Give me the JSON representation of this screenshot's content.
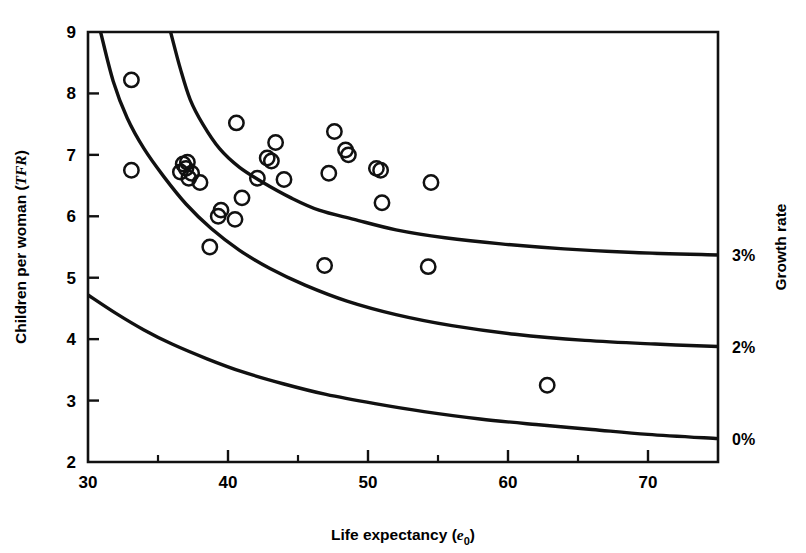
{
  "figure": {
    "background_color": "#ffffff",
    "ink_color": "#111111"
  },
  "axes": {
    "x": {
      "label_main": "Life expectancy (",
      "label_italic": "e",
      "label_sub": "0",
      "label_close": ")",
      "label_full": "Life expectancy (e0)",
      "min": 30,
      "max": 75,
      "major_ticks": [
        30,
        40,
        50,
        60,
        70
      ],
      "major_tick_labels": [
        "30",
        "40",
        "50",
        "60",
        "70"
      ],
      "minor_ticks": [
        35,
        45,
        55,
        65,
        75
      ]
    },
    "y": {
      "label_main": "Children per woman (",
      "label_italic": "TFR",
      "label_close": ")",
      "label_full": "Children per woman (TFR)",
      "min": 2,
      "max": 9,
      "major_ticks": [
        2,
        3,
        4,
        5,
        6,
        7,
        8,
        9
      ],
      "major_tick_labels": [
        "2",
        "3",
        "4",
        "5",
        "6",
        "7",
        "8",
        "9"
      ]
    },
    "right": {
      "label_full": "Growth rate",
      "tick_labels": [
        "3%",
        "2%",
        "0%"
      ],
      "tick_values_tfr": [
        5.37,
        3.88,
        2.38
      ]
    }
  },
  "chart_data": {
    "type": "scatter",
    "title": "",
    "xlabel": "Life expectancy (e0)",
    "ylabel": "Children per woman (TFR)",
    "xlim": [
      30,
      75
    ],
    "ylim": [
      2,
      9
    ],
    "grid": false,
    "legend": "none",
    "series": [
      {
        "name": "Countries",
        "marker": "open-circle",
        "x": [
          33.1,
          33.1,
          36.6,
          36.8,
          37.0,
          37.2,
          37.1,
          37.4,
          38.0,
          38.7,
          39.3,
          39.5,
          40.6,
          40.5,
          41.0,
          42.8,
          42.1,
          43.1,
          43.4,
          44.0,
          46.9,
          47.2,
          47.6,
          48.4,
          48.6,
          50.6,
          50.9,
          51.0,
          54.3,
          54.5,
          62.8
        ],
        "y": [
          8.22,
          6.75,
          6.72,
          6.85,
          6.78,
          6.62,
          6.88,
          6.7,
          6.55,
          5.5,
          6.0,
          6.1,
          7.52,
          5.95,
          6.3,
          6.95,
          6.62,
          6.9,
          7.2,
          6.6,
          5.2,
          6.7,
          7.38,
          7.08,
          7.0,
          6.78,
          6.75,
          6.22,
          5.18,
          6.55,
          3.25
        ]
      }
    ],
    "curves": [
      {
        "name": "growth-rate-3-percent",
        "label": "3%",
        "end_y": 5.37,
        "points": [
          [
            35.9,
            9.0
          ],
          [
            36.6,
            8.4
          ],
          [
            37.3,
            7.9
          ],
          [
            38.2,
            7.5
          ],
          [
            39.4,
            7.1
          ],
          [
            40.8,
            6.8
          ],
          [
            42.5,
            6.55
          ],
          [
            44.5,
            6.3
          ],
          [
            46.5,
            6.1
          ],
          [
            49.0,
            5.95
          ],
          [
            52.0,
            5.78
          ],
          [
            55.5,
            5.65
          ],
          [
            59.5,
            5.55
          ],
          [
            64.0,
            5.47
          ],
          [
            69.0,
            5.41
          ],
          [
            75.0,
            5.37
          ]
        ]
      },
      {
        "name": "growth-rate-2-percent",
        "label": "2%",
        "end_y": 3.88,
        "points": [
          [
            30.9,
            9.0
          ],
          [
            31.8,
            8.2
          ],
          [
            32.8,
            7.6
          ],
          [
            34.0,
            7.1
          ],
          [
            35.4,
            6.65
          ],
          [
            37.0,
            6.2
          ],
          [
            38.8,
            5.8
          ],
          [
            40.8,
            5.45
          ],
          [
            43.0,
            5.15
          ],
          [
            45.5,
            4.88
          ],
          [
            48.5,
            4.62
          ],
          [
            52.0,
            4.4
          ],
          [
            56.0,
            4.22
          ],
          [
            60.5,
            4.08
          ],
          [
            65.5,
            3.98
          ],
          [
            70.5,
            3.92
          ],
          [
            75.0,
            3.88
          ]
        ]
      },
      {
        "name": "growth-rate-0-percent",
        "label": "0%",
        "end_y": 2.38,
        "points": [
          [
            30.0,
            4.72
          ],
          [
            32.0,
            4.42
          ],
          [
            34.0,
            4.15
          ],
          [
            36.0,
            3.92
          ],
          [
            38.5,
            3.68
          ],
          [
            41.0,
            3.47
          ],
          [
            44.0,
            3.27
          ],
          [
            47.0,
            3.1
          ],
          [
            50.5,
            2.95
          ],
          [
            54.0,
            2.82
          ],
          [
            58.0,
            2.7
          ],
          [
            62.0,
            2.61
          ],
          [
            66.0,
            2.53
          ],
          [
            70.0,
            2.45
          ],
          [
            75.0,
            2.38
          ]
        ]
      }
    ]
  }
}
